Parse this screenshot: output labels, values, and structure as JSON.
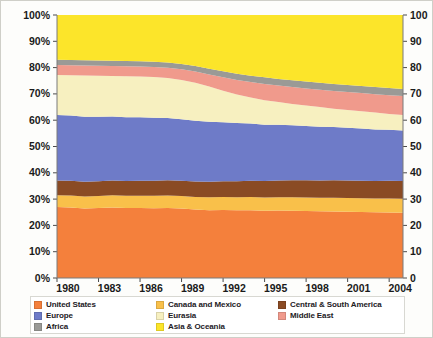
{
  "chart_data": {
    "type": "area",
    "title": "",
    "subtitle": "",
    "xlabel": "",
    "ylabel": "",
    "stacked": true,
    "normalized": true,
    "grid": false,
    "legend_position": "bottom",
    "xlim": [
      1980,
      2005
    ],
    "ylim": [
      0,
      100
    ],
    "left_axis": {
      "ticks": [
        0,
        10,
        20,
        30,
        40,
        50,
        60,
        70,
        80,
        90,
        100
      ],
      "tick_labels": [
        "0%",
        "10%",
        "20%",
        "30%",
        "40%",
        "50%",
        "60%",
        "70%",
        "80%",
        "90%",
        "100%"
      ]
    },
    "right_axis": {
      "ticks": [
        0,
        10,
        20,
        30,
        40,
        50,
        60,
        70,
        80,
        90,
        100
      ],
      "tick_labels": [
        "0",
        "10",
        "20",
        "30",
        "40",
        "50",
        "60",
        "70",
        "80",
        "90",
        "100"
      ]
    },
    "x": [
      1980,
      1981,
      1982,
      1983,
      1984,
      1985,
      1986,
      1987,
      1988,
      1989,
      1990,
      1991,
      1992,
      1993,
      1994,
      1995,
      1996,
      1997,
      1998,
      1999,
      2000,
      2001,
      2002,
      2003,
      2004,
      2005
    ],
    "tick_values": [
      1980,
      1983,
      1986,
      1989,
      1992,
      1995,
      1998,
      2001,
      2004
    ],
    "tick_labels": [
      "1980",
      "1983",
      "1986",
      "1989",
      "1992",
      "1995",
      "1998",
      "2001",
      "2004"
    ],
    "series": [
      {
        "name": "United States",
        "color": "#F4803C",
        "values": [
          27.0,
          26.8,
          26.4,
          26.6,
          26.8,
          26.6,
          26.6,
          26.5,
          26.6,
          26.4,
          26.0,
          25.8,
          25.9,
          25.8,
          25.8,
          25.6,
          25.7,
          25.6,
          25.5,
          25.4,
          25.3,
          25.2,
          25.1,
          25.0,
          24.9,
          24.8
        ]
      },
      {
        "name": "Canada and Mexico",
        "color": "#F9C04A",
        "values": [
          4.5,
          4.6,
          4.6,
          4.6,
          4.7,
          4.7,
          4.7,
          4.8,
          4.8,
          4.8,
          4.8,
          4.9,
          4.9,
          4.9,
          5.0,
          5.0,
          5.0,
          5.1,
          5.1,
          5.1,
          5.2,
          5.2,
          5.2,
          5.2,
          5.3,
          5.3
        ]
      },
      {
        "name": "Central & South America",
        "color": "#8A4B24",
        "values": [
          5.6,
          5.6,
          5.6,
          5.6,
          5.6,
          5.6,
          5.7,
          5.7,
          5.8,
          5.8,
          5.9,
          5.9,
          6.0,
          6.1,
          6.2,
          6.3,
          6.4,
          6.5,
          6.6,
          6.6,
          6.7,
          6.7,
          6.7,
          6.7,
          6.8,
          6.8
        ]
      },
      {
        "name": "Europe",
        "color": "#6E7BC8"
      },
      {
        "name": "Eurasia",
        "color": "#F7F0C0"
      },
      {
        "name": "Middle East",
        "color": "#F09A8C"
      },
      {
        "name": "Africa",
        "color": "#9A9A96"
      },
      {
        "name": "Asia & Oceania",
        "color": "#FCE52A"
      }
    ],
    "series_values": {
      "United States": [
        27.0,
        26.8,
        26.4,
        26.6,
        26.8,
        26.6,
        26.6,
        26.5,
        26.6,
        26.4,
        26.0,
        25.8,
        25.9,
        25.8,
        25.8,
        25.6,
        25.7,
        25.6,
        25.5,
        25.4,
        25.3,
        25.2,
        25.1,
        25.0,
        24.9,
        24.8
      ],
      "Canada and Mexico": [
        4.5,
        4.6,
        4.6,
        4.6,
        4.7,
        4.7,
        4.7,
        4.8,
        4.8,
        4.8,
        4.8,
        4.9,
        4.9,
        4.9,
        5.0,
        5.0,
        5.0,
        5.1,
        5.1,
        5.1,
        5.2,
        5.2,
        5.2,
        5.2,
        5.3,
        5.3
      ],
      "Central & South America": [
        5.6,
        5.6,
        5.6,
        5.6,
        5.6,
        5.6,
        5.7,
        5.7,
        5.8,
        5.8,
        5.9,
        5.9,
        6.0,
        6.1,
        6.2,
        6.3,
        6.4,
        6.5,
        6.6,
        6.6,
        6.7,
        6.7,
        6.7,
        6.7,
        6.8,
        6.8
      ],
      "Europe": [
        24.9,
        24.8,
        24.7,
        24.5,
        24.3,
        24.2,
        24.1,
        23.9,
        23.6,
        23.4,
        23.1,
        22.8,
        22.4,
        22.1,
        21.7,
        21.4,
        21.2,
        20.9,
        20.6,
        20.4,
        20.2,
        20.0,
        19.8,
        19.6,
        19.4,
        19.2
      ]
    },
    "annotations": []
  },
  "legend": {
    "columns": [
      [
        {
          "label": "United States",
          "color": "#F4803C"
        },
        {
          "label": "Europe",
          "color": "#6E7BC8"
        },
        {
          "label": "Africa",
          "color": "#9A9A96"
        }
      ],
      [
        {
          "label": "Canada and Mexico",
          "color": "#F9C04A"
        },
        {
          "label": "Eurasia",
          "color": "#F7F0C0"
        },
        {
          "label": "Asia & Oceania",
          "color": "#FCE52A"
        }
      ],
      [
        {
          "label": "Central & South America",
          "color": "#8A4B24"
        },
        {
          "label": "Middle East",
          "color": "#F09A8C"
        }
      ]
    ]
  }
}
